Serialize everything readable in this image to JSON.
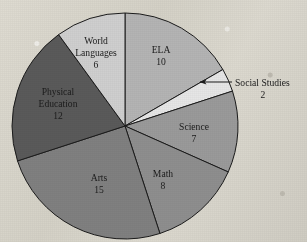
{
  "figure": {
    "background_color": "#d6d3c9",
    "outline_color": "#1b1b1b",
    "label_color": "#1b1b1b"
  },
  "chart_data": {
    "type": "pie",
    "title": "",
    "subtitle": "",
    "xlabel": "",
    "ylabel": "",
    "total": 60,
    "start_angle_deg": 0,
    "direction": "clockwise",
    "legend_position": "none",
    "grid": false,
    "categories": [
      "ELA",
      "Social Studies",
      "Science",
      "Math",
      "Arts",
      "Physical Education",
      "World Languages"
    ],
    "values": [
      10,
      2,
      7,
      8,
      15,
      12,
      6
    ],
    "colors": [
      "#b4b4b4",
      "#e6e6e6",
      "#9a9a9a",
      "#8e8e8e",
      "#808080",
      "#5a5a5a",
      "#cfcfcf"
    ],
    "slices": [
      {
        "label": "ELA",
        "value": 10,
        "value_text": "10",
        "color": "#b4b4b4",
        "start_deg": 0,
        "end_deg": 60,
        "label_placement": "inside",
        "label_x": 161,
        "label_y": 53,
        "value_x": 161,
        "value_y": 65
      },
      {
        "label": "Social Studies",
        "value": 2,
        "value_text": "2",
        "color": "#e6e6e6",
        "start_deg": 60,
        "end_deg": 72,
        "label_placement": "callout",
        "label_x": 235,
        "label_y": 86,
        "value_x": 263,
        "value_y": 98,
        "leader_from_x": 232,
        "leader_from_y": 82,
        "leader_to_x": 200,
        "leader_to_y": 82,
        "arrow": true
      },
      {
        "label": "Science",
        "value": 7,
        "value_text": "7",
        "color": "#9a9a9a",
        "start_deg": 72,
        "end_deg": 114,
        "label_placement": "inside",
        "label_x": 194,
        "label_y": 130,
        "value_x": 194,
        "value_y": 142
      },
      {
        "label": "Math",
        "value": 8,
        "value_text": "8",
        "color": "#8e8e8e",
        "start_deg": 114,
        "end_deg": 162,
        "label_placement": "inside",
        "label_x": 163,
        "label_y": 177,
        "value_x": 163,
        "value_y": 189
      },
      {
        "label": "Arts",
        "value": 15,
        "value_text": "15",
        "color": "#808080",
        "start_deg": 162,
        "end_deg": 252,
        "label_placement": "inside",
        "label_x": 99,
        "label_y": 181,
        "value_x": 99,
        "value_y": 193
      },
      {
        "label": "Physical Education",
        "value": 12,
        "value_text": "12",
        "color": "#5a5a5a",
        "start_deg": 252,
        "end_deg": 324,
        "label_placement": "inside",
        "label_line_1": "Physical",
        "label_line_2": "Education",
        "label_x": 58,
        "label_y": 95,
        "label2_x": 58,
        "label2_y": 107,
        "value_x": 58,
        "value_y": 119
      },
      {
        "label": "World Languages",
        "value": 6,
        "value_text": "6",
        "color": "#cfcfcf",
        "start_deg": 324,
        "end_deg": 360,
        "label_placement": "inside",
        "label_line_1": "World",
        "label_line_2": "Languages",
        "label_x": 96,
        "label_y": 44,
        "label2_x": 96,
        "label2_y": 56,
        "value_x": 96,
        "value_y": 68
      }
    ]
  },
  "geometry": {
    "center_x": 125,
    "center_y": 126,
    "radius": 113
  }
}
